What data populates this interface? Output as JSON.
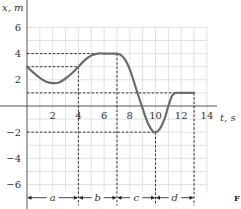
{
  "chart_data": {
    "type": "line",
    "title": "",
    "xlabel": "t, s",
    "ylabel": "x, m",
    "xlim": [
      0,
      14
    ],
    "ylim": [
      -7,
      6
    ],
    "grid": true,
    "x_ticks": [
      2,
      4,
      6,
      8,
      10,
      12,
      14
    ],
    "y_ticks": [
      6,
      4,
      2,
      -2,
      -4,
      -6
    ],
    "series": [
      {
        "name": "x(t)",
        "points": [
          [
            0,
            3
          ],
          [
            0.5,
            2.55
          ],
          [
            1,
            2.15
          ],
          [
            1.5,
            1.85
          ],
          [
            2,
            1.75
          ],
          [
            2.5,
            1.8
          ],
          [
            3,
            2.1
          ],
          [
            3.5,
            2.5
          ],
          [
            4,
            3
          ],
          [
            4.5,
            3.5
          ],
          [
            5,
            3.85
          ],
          [
            5.5,
            4
          ],
          [
            6,
            4
          ],
          [
            6.8,
            4
          ],
          [
            7.2,
            3.95
          ],
          [
            7.6,
            3.6
          ],
          [
            8,
            2.8
          ],
          [
            8.5,
            1.3
          ],
          [
            9,
            -0.2
          ],
          [
            9.4,
            -1.3
          ],
          [
            9.8,
            -1.95
          ],
          [
            10,
            -2
          ],
          [
            10.3,
            -1.8
          ],
          [
            10.7,
            -1
          ],
          [
            11,
            0
          ],
          [
            11.3,
            0.8
          ],
          [
            11.6,
            1
          ],
          [
            12,
            1
          ],
          [
            13,
            1
          ]
        ]
      }
    ],
    "reference_lines": {
      "horizontal": [
        {
          "y": 4,
          "x_from": 0,
          "x_to": 7
        },
        {
          "y": 3,
          "x_from": 0,
          "x_to": 4
        },
        {
          "y": 1,
          "x_from": 0,
          "x_to": 11.6
        },
        {
          "y": -2,
          "x_from": 0,
          "x_to": 10
        }
      ],
      "vertical": [
        {
          "x": 4,
          "y_from": 3,
          "y_to": -7
        },
        {
          "x": 7,
          "y_from": 4,
          "y_to": -7
        },
        {
          "x": 10,
          "y_from": -2,
          "y_to": -7
        },
        {
          "x": 13,
          "y_from": 1,
          "y_to": -7
        }
      ]
    },
    "intervals": [
      {
        "label": "a",
        "from": 0,
        "to": 4
      },
      {
        "label": "b",
        "from": 4,
        "to": 7
      },
      {
        "label": "c",
        "from": 7,
        "to": 10
      },
      {
        "label": "d",
        "from": 10,
        "to": 13
      }
    ],
    "annotations": [
      {
        "text": "a",
        "x": 2,
        "y": -6.9
      },
      {
        "text": "b",
        "x": 5.5,
        "y": -6.9
      },
      {
        "text": "c",
        "x": 8.5,
        "y": -6.9
      },
      {
        "text": "d",
        "x": 11.5,
        "y": -6.9
      }
    ]
  },
  "labels": {
    "y_axis": "x, m",
    "x_axis": "t, s",
    "x_tick_labels": [
      "2",
      "4",
      "6",
      "8",
      "10",
      "12",
      "14"
    ],
    "y_tick_labels": [
      "6",
      "4",
      "2",
      "−2",
      "−4",
      "−6"
    ],
    "interval_labels": [
      "a",
      "b",
      "c",
      "d"
    ],
    "corner_fragment": "F"
  }
}
